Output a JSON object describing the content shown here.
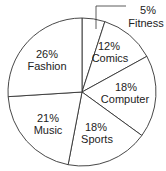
{
  "chart_data": {
    "type": "pie",
    "title": "",
    "categories": [
      "Fitness",
      "Comics",
      "Computer",
      "Sports",
      "Music",
      "Fashion"
    ],
    "values": [
      5,
      12,
      18,
      18,
      21,
      26
    ],
    "labels": [
      "5%",
      "12%",
      "18%",
      "18%",
      "21%",
      "26%"
    ],
    "start_angle": "12 o'clock",
    "direction": "clockwise",
    "colors": {
      "fill": "#ffffff",
      "stroke": "#333333",
      "text": "#222222"
    },
    "legend": "none",
    "annotations": [
      "Fitness label placed outside with leader line"
    ]
  }
}
